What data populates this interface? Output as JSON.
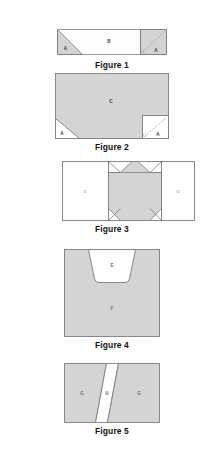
{
  "document": {
    "title": "Geometric dissection figures",
    "background_color": "#ffffff",
    "fill_shaded": "#d4d4d4",
    "fill_white": "#ffffff",
    "stroke_color": "#7d7d7d",
    "caption_color": "#111111"
  },
  "figures": [
    {
      "caption": "Figure 1",
      "description": "Wide rectangle divided into a left triangle, a central region and a right square with dashed diagonal",
      "parts": [
        {
          "label": "A",
          "shape": "triangle-left",
          "fill": "shaded"
        },
        {
          "label": "B",
          "shape": "quadrilateral-center",
          "fill": "white"
        },
        {
          "label": "A",
          "shape": "square-right-dashed",
          "fill": "shaded"
        }
      ]
    },
    {
      "caption": "Figure 2",
      "description": "Large shaded region with a white triangle cut from the bottom-left corner and a white square with dashed diagonal at the bottom-right corner",
      "parts": [
        {
          "label": "C",
          "shape": "large-region",
          "fill": "shaded"
        },
        {
          "label": "A",
          "shape": "triangle-bottom-left",
          "fill": "white"
        },
        {
          "label": "A",
          "shape": "square-bottom-right-dashed",
          "fill": "white"
        }
      ]
    },
    {
      "caption": "Figure 3",
      "description": "Three panels: white square, shaded hexagonal core with white corner triangles, white square",
      "parts": [
        {
          "label": "D",
          "shape": "square-left",
          "fill": "white"
        },
        {
          "label": "",
          "shape": "shaded-core-with-corners",
          "fill": "shaded"
        },
        {
          "label": "D",
          "shape": "square-right",
          "fill": "white"
        }
      ]
    },
    {
      "caption": "Figure 4",
      "description": "Shaded square with a white rounded trapezoid notch cut into the top edge",
      "parts": [
        {
          "label": "E",
          "shape": "trapezoid-notch",
          "fill": "white"
        },
        {
          "label": "F",
          "shape": "square-body",
          "fill": "shaded"
        }
      ]
    },
    {
      "caption": "Figure 5",
      "description": "Rectangle split by a white slanted strip into two shaded pieces",
      "parts": [
        {
          "label": "G",
          "shape": "left-piece",
          "fill": "shaded"
        },
        {
          "label": "H",
          "shape": "slanted-strip",
          "fill": "white"
        },
        {
          "label": "G",
          "shape": "right-piece",
          "fill": "shaded"
        }
      ]
    }
  ]
}
